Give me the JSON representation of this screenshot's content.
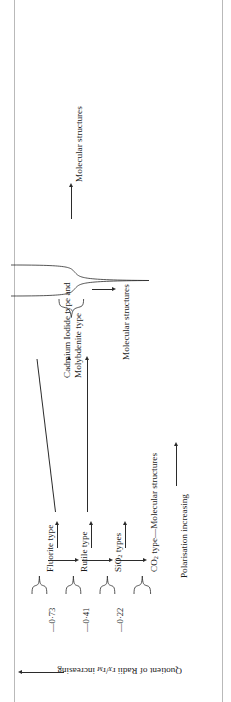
{
  "figure": {
    "orientation": "rotated-90-ccw",
    "type": "chemistry-structure-classification-diagram",
    "ink_color": "#2b2b2b",
    "rule_color": "#b9b9b9"
  },
  "axis_bottom": {
    "label": "Quotient of Radii r",
    "label_sub1": "X",
    "label_mid": "/r",
    "label_sub2": "M",
    "label_tail": " increasing",
    "full": "Quotient of Radii rX/rM increasing",
    "arrow": "arrow-left"
  },
  "axis_polarisation": {
    "label": "Polarisation increasing",
    "arrow": "arrow-right"
  },
  "ratios": [
    {
      "value": "0.73",
      "display": "—0·73"
    },
    {
      "value": "0.41",
      "display": "—0·41"
    },
    {
      "value": "0.22",
      "display": "—0·22"
    }
  ],
  "structure_row": [
    {
      "name": "Fluorite type",
      "label": "Fluorite type"
    },
    {
      "name": "Rutile type",
      "label": "Rutile type"
    },
    {
      "name": "SiO2 types",
      "label_pre": "SiO",
      "label_sub": "2",
      "label_post": " types"
    },
    {
      "name": "CO2 type",
      "label_pre": "CO",
      "label_sub": "2",
      "label_post": " type—Molecular structures"
    }
  ],
  "grouped_label": {
    "line1": "Cadmium Iodide type and",
    "line2": "Molybdenite type"
  },
  "molecular_lower": "Molecular structures",
  "molecular_upper": "Molecular structures"
}
